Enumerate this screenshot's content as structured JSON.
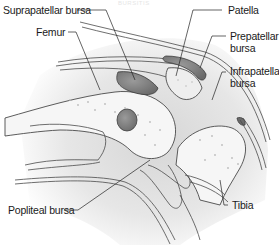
{
  "diagram": {
    "watermark": "BURSITIS",
    "colors": {
      "outline": "#4a4a4a",
      "bone": "#f4f4f4",
      "soft_tissue": "#d6d6d6",
      "bursa": "#7d7d7d",
      "leader_line": "#222222"
    },
    "labels": [
      {
        "id": "suprapatellar-bursa",
        "text": "Suprapatellar bursa"
      },
      {
        "id": "femur",
        "text": "Femur"
      },
      {
        "id": "patella",
        "text": "Patella"
      },
      {
        "id": "prepatellar-bursa-line1",
        "text": "Prepatellar"
      },
      {
        "id": "prepatellar-bursa-line2",
        "text": "bursa"
      },
      {
        "id": "infrapatellar-bursa-line1",
        "text": "Infrapatellar"
      },
      {
        "id": "infrapatellar-bursa-line2",
        "text": "bursa"
      },
      {
        "id": "popliteal-bursa",
        "text": "Popliteal bursa"
      },
      {
        "id": "tibia",
        "text": "Tibia"
      }
    ]
  }
}
